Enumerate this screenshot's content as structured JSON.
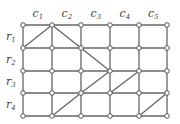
{
  "diagram": {
    "type": "grid-graph",
    "columns": {
      "x": [
        23,
        52,
        81,
        110,
        139,
        167
      ],
      "labels": [
        {
          "base": "c",
          "sub": "1"
        },
        {
          "base": "c",
          "sub": "2"
        },
        {
          "base": "c",
          "sub": "3"
        },
        {
          "base": "c",
          "sub": "4"
        },
        {
          "base": "c",
          "sub": "5"
        }
      ]
    },
    "rows": {
      "y": [
        25,
        48,
        71,
        93,
        116
      ],
      "labels": [
        {
          "base": "r",
          "sub": "1"
        },
        {
          "base": "r",
          "sub": "2"
        },
        {
          "base": "r",
          "sub": "3"
        },
        {
          "base": "r",
          "sub": "4"
        }
      ]
    },
    "diagonals": [
      [
        [
          0,
          1
        ],
        [
          1,
          0
        ]
      ],
      [
        [
          1,
          0
        ],
        [
          2,
          1
        ]
      ],
      [
        [
          2,
          1
        ],
        [
          3,
          2
        ]
      ],
      [
        [
          1,
          4
        ],
        [
          2,
          3
        ]
      ],
      [
        [
          2,
          3
        ],
        [
          3,
          2
        ]
      ],
      [
        [
          3,
          3
        ],
        [
          4,
          2
        ]
      ],
      [
        [
          4,
          4
        ],
        [
          5,
          3
        ]
      ]
    ],
    "colors": {
      "edge": "#666666",
      "node_fill": "#ffffff",
      "node_stroke": "#555555",
      "label": "#444444"
    }
  }
}
